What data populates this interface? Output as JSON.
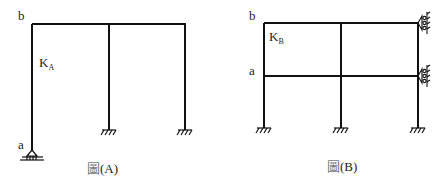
{
  "figure_a": {
    "caption_glyph": "圖",
    "caption": "(A)",
    "label_top_left": "b",
    "label_bottom_left": "a",
    "stiffness_label": "K",
    "stiffness_sub": "A",
    "supports": [
      "pin-support",
      "fixed-support",
      "fixed-support"
    ]
  },
  "figure_b": {
    "caption_glyph": "圖",
    "caption": "(B)",
    "label_top_left": "b",
    "label_mid_left": "a",
    "stiffness_label": "K",
    "stiffness_sub": "B",
    "supports": [
      "fixed-support",
      "fixed-support",
      "fixed-support",
      "roller-support",
      "roller-support"
    ]
  },
  "colors": {
    "line": "#111111",
    "text": "#222222",
    "background": "#ffffff"
  }
}
